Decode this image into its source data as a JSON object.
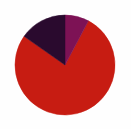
{
  "background_color": "#fefefe",
  "chart_data": {
    "type": "pie",
    "title": "",
    "subtitle": "",
    "xlabel": "",
    "ylabel": "",
    "legend": false,
    "legend_position": "none",
    "grid": false,
    "labels_shown": false,
    "center": {
      "x": 65,
      "y": 65
    },
    "radius": 50,
    "start_angle_deg": 0,
    "direction": "clockwise",
    "total": 100,
    "categories": [
      "Segment 1",
      "Segment 2",
      "Segment 3"
    ],
    "values": [
      77,
      8,
      15
    ],
    "colors": [
      "#c71c12",
      "#7d1255",
      "#2a0a2e"
    ],
    "slices": [
      {
        "label": "Segment 1",
        "value": 77,
        "percent": 77,
        "color": "#c71c12",
        "start_angle_deg": 28,
        "end_angle_deg": 305
      },
      {
        "label": "Segment 2",
        "value": 8,
        "percent": 8,
        "color": "#7d1255",
        "start_angle_deg": 0,
        "end_angle_deg": 28
      },
      {
        "label": "Segment 3",
        "value": 15,
        "percent": 15,
        "color": "#2a0a2e",
        "start_angle_deg": 305,
        "end_angle_deg": 360
      }
    ]
  }
}
